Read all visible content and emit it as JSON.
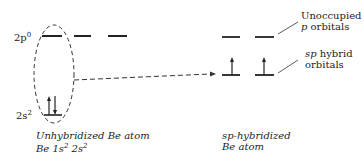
{
  "left_levels": {
    "upper_label": "2p",
    "upper_sup": "0",
    "lower_label": "2s",
    "lower_sup": "2"
  },
  "left_caption": {
    "line1": "Unhybridized Be  atom",
    "line2_prefix": "Be 1s",
    "line2_sup1": "2",
    "line2_mid": " 2s",
    "line2_sup2": "2"
  },
  "right_caption": {
    "line1": "sp-hybridized",
    "line2": "Be atom"
  },
  "annotations": {
    "unoccupied_line1": "Unoccupied",
    "unoccupied_line2_italic": "p",
    "unoccupied_line2_rest": " orbitals",
    "hybrid_line1_italic": "sp",
    "hybrid_line1_rest": " hybrid",
    "hybrid_line2": "orbitals"
  },
  "colors": {
    "ink": "#222222"
  }
}
